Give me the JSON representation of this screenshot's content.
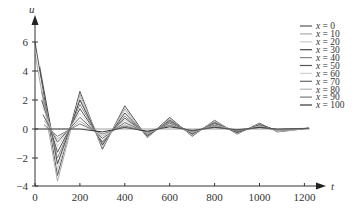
{
  "chart_data": {
    "type": "line",
    "title": "",
    "xlabel": "t",
    "ylabel": "u",
    "xlim": [
      0,
      1300
    ],
    "ylim": [
      -4,
      7
    ],
    "x_ticks": [
      0,
      200,
      400,
      600,
      800,
      1000,
      1200
    ],
    "y_ticks": [
      -4,
      -2,
      0,
      2,
      4,
      6
    ],
    "grid": false,
    "legend_position": "upper right",
    "series": [
      {
        "name": "x = 0",
        "color": "#555555",
        "points": [
          [
            0,
            6.0
          ],
          [
            100,
            -3.2
          ],
          [
            200,
            2.6
          ],
          [
            300,
            -1.4
          ],
          [
            400,
            1.6
          ],
          [
            500,
            -0.6
          ],
          [
            600,
            0.8
          ],
          [
            700,
            -0.5
          ],
          [
            800,
            0.6
          ],
          [
            900,
            -0.35
          ],
          [
            1000,
            0.4
          ],
          [
            1080,
            -0.2
          ],
          [
            1220,
            0.05
          ]
        ]
      },
      {
        "name": "x = 10",
        "color": "#aaaaaa",
        "points": [
          [
            0,
            5.2
          ],
          [
            100,
            -3.6
          ],
          [
            200,
            2.4
          ],
          [
            300,
            -1.3
          ],
          [
            400,
            1.4
          ],
          [
            500,
            -0.6
          ],
          [
            600,
            0.7
          ],
          [
            700,
            -0.45
          ],
          [
            800,
            0.55
          ],
          [
            900,
            -0.3
          ],
          [
            1000,
            0.35
          ],
          [
            1080,
            -0.15
          ],
          [
            1220,
            0.05
          ]
        ]
      },
      {
        "name": "x = 20",
        "color": "#cccccc",
        "points": [
          [
            20,
            4.5
          ],
          [
            100,
            -2.8
          ],
          [
            200,
            2.2
          ],
          [
            300,
            -1.2
          ],
          [
            400,
            1.3
          ],
          [
            500,
            -0.55
          ],
          [
            600,
            0.65
          ],
          [
            700,
            -0.4
          ],
          [
            800,
            0.5
          ],
          [
            900,
            -0.3
          ],
          [
            1000,
            0.3
          ],
          [
            1080,
            -0.15
          ],
          [
            1220,
            0.05
          ]
        ]
      },
      {
        "name": "x = 30",
        "color": "#444444",
        "points": [
          [
            20,
            4.3
          ],
          [
            100,
            -2.4
          ],
          [
            200,
            2.0
          ],
          [
            300,
            -1.1
          ],
          [
            400,
            1.1
          ],
          [
            500,
            -0.5
          ],
          [
            600,
            0.6
          ],
          [
            700,
            -0.35
          ],
          [
            800,
            0.45
          ],
          [
            900,
            -0.25
          ],
          [
            1000,
            0.3
          ],
          [
            1080,
            -0.1
          ],
          [
            1220,
            0.05
          ]
        ]
      },
      {
        "name": "x = 40",
        "color": "#888888",
        "points": [
          [
            30,
            2.6
          ],
          [
            100,
            -2.0
          ],
          [
            200,
            1.7
          ],
          [
            300,
            -1.0
          ],
          [
            400,
            0.9
          ],
          [
            500,
            -0.45
          ],
          [
            600,
            0.55
          ],
          [
            700,
            -0.3
          ],
          [
            800,
            0.4
          ],
          [
            900,
            -0.2
          ],
          [
            1000,
            0.25
          ],
          [
            1080,
            -0.1
          ],
          [
            1220,
            0.05
          ]
        ]
      },
      {
        "name": "x = 50",
        "color": "#555555",
        "points": [
          [
            30,
            2.0
          ],
          [
            100,
            -1.6
          ],
          [
            200,
            1.4
          ],
          [
            300,
            -0.9
          ],
          [
            400,
            0.75
          ],
          [
            500,
            -0.4
          ],
          [
            600,
            0.5
          ],
          [
            700,
            -0.3
          ],
          [
            800,
            0.35
          ],
          [
            900,
            -0.2
          ],
          [
            1000,
            0.2
          ],
          [
            1080,
            -0.1
          ],
          [
            1220,
            0.05
          ]
        ]
      },
      {
        "name": "x = 60",
        "color": "#d0d0d0",
        "points": [
          [
            35,
            1.5
          ],
          [
            100,
            -1.2
          ],
          [
            200,
            1.1
          ],
          [
            300,
            -0.8
          ],
          [
            400,
            0.6
          ],
          [
            500,
            -0.35
          ],
          [
            600,
            0.45
          ],
          [
            700,
            -0.25
          ],
          [
            800,
            0.3
          ],
          [
            900,
            -0.15
          ],
          [
            1000,
            0.2
          ],
          [
            1080,
            -0.1
          ],
          [
            1220,
            0.05
          ]
        ]
      },
      {
        "name": "x = 70",
        "color": "#666666",
        "points": [
          [
            35,
            1.0
          ],
          [
            100,
            -0.9
          ],
          [
            200,
            0.8
          ],
          [
            300,
            -0.65
          ],
          [
            400,
            0.45
          ],
          [
            500,
            -0.3
          ],
          [
            600,
            0.4
          ],
          [
            700,
            -0.2
          ],
          [
            800,
            0.25
          ],
          [
            900,
            -0.15
          ],
          [
            1000,
            0.15
          ],
          [
            1080,
            -0.05
          ],
          [
            1220,
            0.05
          ]
        ]
      },
      {
        "name": "x = 80",
        "color": "#b5b5b5",
        "points": [
          [
            40,
            0.6
          ],
          [
            100,
            -0.7
          ],
          [
            200,
            0.55
          ],
          [
            300,
            -0.5
          ],
          [
            400,
            0.3
          ],
          [
            500,
            -0.25
          ],
          [
            600,
            0.3
          ],
          [
            700,
            -0.2
          ],
          [
            800,
            0.2
          ],
          [
            900,
            -0.1
          ],
          [
            1000,
            0.15
          ],
          [
            1080,
            -0.05
          ],
          [
            1220,
            0.05
          ]
        ]
      },
      {
        "name": "x = 90",
        "color": "#7a7a7a",
        "points": [
          [
            40,
            0.3
          ],
          [
            100,
            -0.5
          ],
          [
            200,
            0.35
          ],
          [
            300,
            -0.35
          ],
          [
            400,
            0.2
          ],
          [
            500,
            -0.2
          ],
          [
            600,
            0.25
          ],
          [
            700,
            -0.15
          ],
          [
            800,
            0.15
          ],
          [
            900,
            -0.1
          ],
          [
            1000,
            0.1
          ],
          [
            1080,
            -0.05
          ],
          [
            1220,
            0.05
          ]
        ]
      },
      {
        "name": "x = 100",
        "color": "#333333",
        "points": [
          [
            0,
            0.0
          ],
          [
            100,
            0.0
          ],
          [
            200,
            0.0
          ],
          [
            300,
            -0.2
          ],
          [
            400,
            0.1
          ],
          [
            500,
            -0.15
          ],
          [
            600,
            0.15
          ],
          [
            700,
            -0.1
          ],
          [
            800,
            0.1
          ],
          [
            900,
            -0.05
          ],
          [
            1000,
            0.1
          ],
          [
            1080,
            0.0
          ],
          [
            1220,
            0.05
          ]
        ]
      }
    ]
  },
  "plot": {
    "origin_px": [
      35,
      129
    ],
    "x_px_per_unit": 0.2245,
    "y_px_per_unit": 14.5,
    "x_axis_y_px": 186,
    "x_axis_end_px": 326,
    "y_axis_top_px": 18
  }
}
